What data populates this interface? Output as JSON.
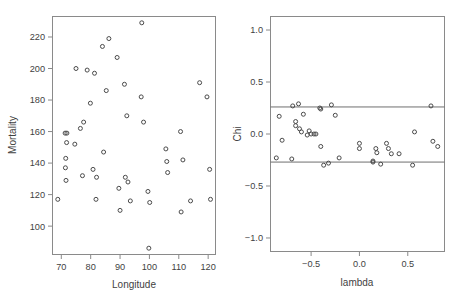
{
  "figure": {
    "background": "#ffffff",
    "point_color": "#4a4a4a",
    "frame_color": "#8a8a8a",
    "text_color": "#3f3f3f"
  },
  "chart_data": [
    {
      "type": "scatter",
      "name": "mortality-vs-longitude",
      "title": "",
      "xlabel": "Longitude",
      "ylabel": "Mortality",
      "xlim": [
        67.0,
        122.5
      ],
      "ylim": [
        82.0,
        233.0
      ],
      "xticks": [
        70,
        80,
        90,
        100,
        110,
        120
      ],
      "xticklabels": [
        "70",
        "80",
        "90",
        "100",
        "110",
        "120"
      ],
      "yticks": [
        100,
        120,
        140,
        160,
        180,
        200,
        220
      ],
      "yticklabels": [
        "100",
        "120",
        "140",
        "160",
        "180",
        "200",
        "220"
      ],
      "grid": false,
      "legend": "none",
      "marker": "open-circle",
      "points": [
        [
          68.8,
          117
        ],
        [
          71.3,
          159
        ],
        [
          71.9,
          159
        ],
        [
          71.8,
          153
        ],
        [
          71.5,
          143
        ],
        [
          71.4,
          137
        ],
        [
          71.6,
          129
        ],
        [
          74.6,
          152
        ],
        [
          75.0,
          200
        ],
        [
          76.5,
          162
        ],
        [
          77.6,
          166
        ],
        [
          77.2,
          132
        ],
        [
          78.8,
          199
        ],
        [
          79.9,
          178
        ],
        [
          80.8,
          136
        ],
        [
          81.3,
          197
        ],
        [
          82.0,
          131
        ],
        [
          81.8,
          117
        ],
        [
          84.0,
          214
        ],
        [
          84.4,
          147
        ],
        [
          86.2,
          219
        ],
        [
          85.3,
          186
        ],
        [
          89.0,
          207
        ],
        [
          89.6,
          124
        ],
        [
          90.0,
          110
        ],
        [
          91.5,
          190
        ],
        [
          91.8,
          131
        ],
        [
          92.7,
          128
        ],
        [
          93.5,
          116
        ],
        [
          92.3,
          170
        ],
        [
          97.4,
          229
        ],
        [
          97.2,
          182
        ],
        [
          98.0,
          166
        ],
        [
          99.5,
          122
        ],
        [
          100.1,
          115
        ],
        [
          99.8,
          86
        ],
        [
          105.6,
          149
        ],
        [
          105.9,
          141
        ],
        [
          106.2,
          134
        ],
        [
          110.6,
          160
        ],
        [
          111.4,
          142
        ],
        [
          110.8,
          109
        ],
        [
          114.0,
          116
        ],
        [
          117.1,
          191
        ],
        [
          119.6,
          182
        ],
        [
          120.5,
          136
        ],
        [
          120.8,
          117
        ]
      ]
    },
    {
      "type": "scatter",
      "name": "chi-vs-lambda",
      "title": "",
      "xlabel": "lambda",
      "ylabel": "Chi",
      "xlim": [
        -0.92,
        0.88
      ],
      "ylim": [
        -1.13,
        1.13
      ],
      "xticks": [
        -0.5,
        0.0,
        0.5
      ],
      "xticklabels": [
        "−0.5",
        "0.0",
        "0.5"
      ],
      "yticks": [
        -1.0,
        -0.5,
        0.0,
        0.5,
        1.0
      ],
      "yticklabels": [
        "−1.0",
        "−0.5",
        "0.0",
        "0.5",
        "1.0"
      ],
      "grid": false,
      "legend": "none",
      "marker": "open-circle",
      "reference_lines": [
        {
          "orientation": "horizontal",
          "value": 0.26
        },
        {
          "orientation": "horizontal",
          "value": -0.27
        }
      ],
      "points": [
        [
          -0.86,
          -0.23
        ],
        [
          -0.83,
          0.17
        ],
        [
          -0.8,
          -0.06
        ],
        [
          -0.7,
          -0.24
        ],
        [
          -0.69,
          0.27
        ],
        [
          -0.66,
          0.12
        ],
        [
          -0.66,
          0.08
        ],
        [
          -0.63,
          0.29
        ],
        [
          -0.62,
          0.05
        ],
        [
          -0.6,
          0.02
        ],
        [
          -0.58,
          0.19
        ],
        [
          -0.54,
          -0.01
        ],
        [
          -0.52,
          0.03
        ],
        [
          -0.5,
          0.0
        ],
        [
          -0.47,
          0.0
        ],
        [
          -0.45,
          -0.0
        ],
        [
          -0.41,
          0.25
        ],
        [
          -0.4,
          0.24
        ],
        [
          -0.4,
          -0.12
        ],
        [
          -0.37,
          -0.3
        ],
        [
          -0.32,
          -0.28
        ],
        [
          -0.29,
          0.28
        ],
        [
          -0.25,
          0.18
        ],
        [
          -0.21,
          -0.23
        ],
        [
          0.0,
          -0.09
        ],
        [
          0.0,
          -0.14
        ],
        [
          0.14,
          -0.26
        ],
        [
          0.14,
          -0.27
        ],
        [
          0.17,
          -0.14
        ],
        [
          0.18,
          -0.18
        ],
        [
          0.22,
          -0.29
        ],
        [
          0.28,
          -0.09
        ],
        [
          0.3,
          -0.14
        ],
        [
          0.33,
          -0.19
        ],
        [
          0.41,
          -0.19
        ],
        [
          0.55,
          -0.3
        ],
        [
          0.57,
          0.02
        ],
        [
          0.74,
          0.27
        ],
        [
          0.76,
          -0.07
        ],
        [
          0.81,
          -0.12
        ]
      ]
    }
  ]
}
